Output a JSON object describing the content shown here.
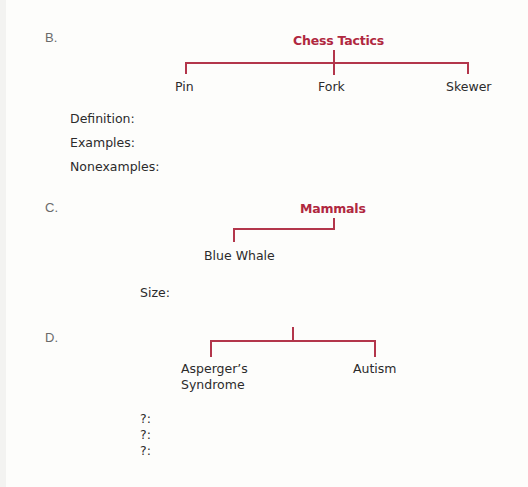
{
  "colors": {
    "accent": "#b0283f",
    "line": "#b3364b",
    "text": "#2b2b2b",
    "letter": "#6a6a6a"
  },
  "sections": [
    {
      "letter": "B.",
      "title": "Chess Tactics",
      "children": [
        "Pin",
        "Fork",
        "Skewer"
      ],
      "fields": [
        "Definition:",
        "Examples:",
        "Nonexamples:"
      ]
    },
    {
      "letter": "C.",
      "title": "Mammals",
      "children": [
        "Blue Whale"
      ],
      "fields": [
        "Size:"
      ]
    },
    {
      "letter": "D.",
      "title": "",
      "children": [
        "Asperger’s Syndrome",
        "Autism"
      ],
      "child_lines": [
        [
          "Asperger’s",
          "Syndrome"
        ],
        [
          "Autism"
        ]
      ],
      "fields": [
        "?:",
        "?:",
        "?:"
      ]
    }
  ]
}
